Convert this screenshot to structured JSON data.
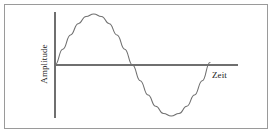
{
  "figure": {
    "background_color": "#ffffff",
    "frame_color": "#9a9a9a",
    "stroke_color": "#6f6f6f",
    "text_color": "#222222"
  },
  "labels": {
    "y_axis": "Amplitude",
    "x_axis": "Zeit"
  },
  "chart_data": {
    "type": "line",
    "title": "",
    "subtitle": "",
    "xlabel": "Zeit",
    "ylabel": "Amplitude",
    "grid": false,
    "legend": "none",
    "xlim": [
      0,
      1
    ],
    "ylim": [
      -1,
      1
    ],
    "x_tick_labels": [],
    "y_tick_labels": [],
    "annotations": [],
    "series": [
      {
        "name": "Sinus",
        "color": "#6f6f6f",
        "x": [
          0.0,
          0.05,
          0.1,
          0.15,
          0.2,
          0.25,
          0.3,
          0.35,
          0.4,
          0.45,
          0.5,
          0.55,
          0.6,
          0.65,
          0.7,
          0.75,
          0.8,
          0.85,
          0.9,
          0.95,
          1.0
        ],
        "y": [
          0.0,
          0.31,
          0.59,
          0.81,
          0.95,
          1.0,
          0.95,
          0.81,
          0.59,
          0.31,
          0.0,
          -0.31,
          -0.59,
          -0.81,
          -0.95,
          -1.0,
          -0.95,
          -0.81,
          -0.59,
          -0.31,
          0.05
        ]
      }
    ],
    "axis_geometry": {
      "origin_px": [
        55,
        65
      ],
      "y_axis_top_px": [
        55,
        12
      ],
      "y_axis_bottom_px": [
        55,
        118
      ],
      "x_axis_right_px": [
        238,
        65
      ],
      "peak_px": [
        92,
        14
      ],
      "zero_cross_px": [
        129,
        65
      ],
      "trough_px": [
        165,
        115
      ],
      "curve_end_px": [
        210,
        58
      ]
    }
  }
}
